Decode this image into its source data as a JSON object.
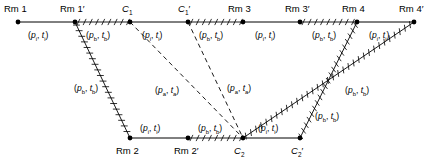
{
  "diagram": {
    "colors": {
      "stroke": "#000000",
      "background": "#ffffff"
    },
    "nodes": [
      {
        "id": "rm1",
        "label": "Rm 1",
        "x": 18,
        "y": 22,
        "label_x": 4,
        "label_y": 4
      },
      {
        "id": "rm1p",
        "label": "Rm 1'",
        "x": 75,
        "y": 22,
        "label_x": 60,
        "label_y": 4
      },
      {
        "id": "c1",
        "label": "C1",
        "x": 130,
        "y": 22,
        "label_x": 122,
        "label_y": 4
      },
      {
        "id": "c1p",
        "label": "C1'",
        "x": 188,
        "y": 22,
        "label_x": 178,
        "label_y": 4
      },
      {
        "id": "rm3",
        "label": "Rm 3",
        "x": 243,
        "y": 22,
        "label_x": 228,
        "label_y": 4
      },
      {
        "id": "rm3p",
        "label": "Rm 3'",
        "x": 300,
        "y": 22,
        "label_x": 285,
        "label_y": 4
      },
      {
        "id": "rm4",
        "label": "Rm 4",
        "x": 357,
        "y": 22,
        "label_x": 342,
        "label_y": 4
      },
      {
        "id": "rm4p",
        "label": "Rm 4'",
        "x": 414,
        "y": 22,
        "label_x": 399,
        "label_y": 4
      },
      {
        "id": "rm2",
        "label": "Rm 2",
        "x": 130,
        "y": 138,
        "label_x": 116,
        "label_y": 146
      },
      {
        "id": "rm2p",
        "label": "Rm 2'",
        "x": 188,
        "y": 138,
        "label_x": 174,
        "label_y": 146
      },
      {
        "id": "c2",
        "label": "C2",
        "x": 243,
        "y": 138,
        "label_x": 234,
        "label_y": 146
      },
      {
        "id": "c2p",
        "label": "C2'",
        "x": 300,
        "y": 138,
        "label_x": 291,
        "label_y": 146
      }
    ],
    "edges": [
      {
        "id": "top-rm1-rm1p",
        "from": "rm1",
        "to": "rm1p",
        "style": "plain"
      },
      {
        "id": "top-rm1p-c1",
        "from": "rm1p",
        "to": "c1",
        "style": "hatched"
      },
      {
        "id": "top-c1-c1p",
        "from": "c1",
        "to": "c1p",
        "style": "plain"
      },
      {
        "id": "top-c1p-rm3",
        "from": "c1p",
        "to": "rm3",
        "style": "hatched"
      },
      {
        "id": "top-rm3-rm3p",
        "from": "rm3",
        "to": "rm3p",
        "style": "plain"
      },
      {
        "id": "top-rm3p-rm4",
        "from": "rm3p",
        "to": "rm4",
        "style": "hatched"
      },
      {
        "id": "top-rm4-rm4p",
        "from": "rm4",
        "to": "rm4p",
        "style": "plain"
      },
      {
        "id": "bot-rm2-rm2p",
        "from": "rm2",
        "to": "rm2p",
        "style": "plain"
      },
      {
        "id": "bot-rm2p-c2",
        "from": "rm2p",
        "to": "c2",
        "style": "hatched"
      },
      {
        "id": "bot-c2-c2p",
        "from": "c2",
        "to": "c2p",
        "style": "plain"
      },
      {
        "id": "diag-rm1p-rm2",
        "from": "rm1p",
        "to": "rm2",
        "style": "hatched"
      },
      {
        "id": "diag-c1-c2",
        "from": "c1",
        "to": "c2",
        "style": "dashed"
      },
      {
        "id": "diag-c1p-c2",
        "from": "c1p",
        "to": "c2",
        "style": "dashed"
      },
      {
        "id": "diag-c2-rm4p",
        "from": "c2",
        "to": "rm4p",
        "style": "hatched"
      },
      {
        "id": "diag-rm4-c2p",
        "from": "rm4",
        "to": "c2p",
        "style": "hatched"
      }
    ],
    "edge_labels": [
      {
        "id": "lbl-rm1-rm1p",
        "p": "i",
        "t": "i",
        "x": 28,
        "y": 31
      },
      {
        "id": "lbl-rm1p-c1",
        "p": "b",
        "t": "b",
        "x": 86,
        "y": 31
      },
      {
        "id": "lbl-c1-c1p",
        "p": "i",
        "t": "i",
        "x": 142,
        "y": 31
      },
      {
        "id": "lbl-c1p-rm3",
        "p": "b",
        "t": "b",
        "x": 199,
        "y": 31
      },
      {
        "id": "lbl-rm3-rm3p",
        "p": "i",
        "t": "i",
        "x": 255,
        "y": 31
      },
      {
        "id": "lbl-rm3p-rm4",
        "p": "b",
        "t": "b",
        "x": 312,
        "y": 31
      },
      {
        "id": "lbl-rm4-rm4p",
        "p": "i",
        "t": "i",
        "x": 369,
        "y": 31
      },
      {
        "id": "lbl-diag-left",
        "p": "b",
        "t": "b",
        "x": 74,
        "y": 84
      },
      {
        "id": "lbl-diag-mid",
        "p": "a",
        "t": "a",
        "x": 155,
        "y": 86
      },
      {
        "id": "lbl-diag-mid2",
        "p": "a",
        "t": "a",
        "x": 227,
        "y": 84
      },
      {
        "id": "lbl-diag-r1",
        "p": "b",
        "t": "b",
        "x": 345,
        "y": 86
      },
      {
        "id": "lbl-diag-r2",
        "p": "b",
        "t": "b",
        "x": 315,
        "y": 112
      },
      {
        "id": "lbl-rm2-rm2p",
        "p": "i",
        "t": "i",
        "x": 140,
        "y": 124
      },
      {
        "id": "lbl-rm2p-c2",
        "p": "b",
        "t": "b",
        "x": 198,
        "y": 124
      },
      {
        "id": "lbl-c2-c2p",
        "p": "i",
        "t": "i",
        "x": 258,
        "y": 124
      }
    ]
  }
}
